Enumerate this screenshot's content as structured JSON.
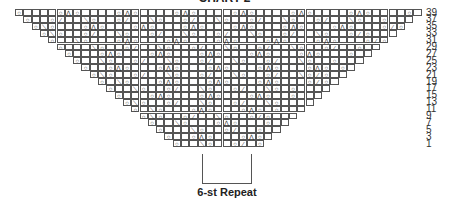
{
  "title": "CHART 2",
  "chart_data": {
    "type": "table",
    "title": "CHART 2",
    "row_labels": [
      "39",
      "37",
      "35",
      "33",
      "31",
      "29",
      "27",
      "25",
      "23",
      "21",
      "19",
      "17",
      "15",
      "13",
      "11",
      "9",
      "7",
      "5",
      "3",
      "1"
    ],
    "legend_symbols": {
      "o": "yarn over",
      "a": "central double decrease",
      "/": "k2tog",
      "\\": "ssk",
      ".": "knit"
    },
    "repeat_label": "6-st Repeat",
    "repeat_width_sts": 6
  },
  "repeat_label": "6-st Repeat",
  "grid": {
    "cell_w": 8.3,
    "row_h": 6.9,
    "left": 15,
    "top": 9,
    "total_cols": 49,
    "rows": [
      "o....oao....oao....oao....oao....oao....oao....o",
      "o..o/..\\o..o/..\\o..o/..\\o..o/..\\o..o/..\\o..o",
      "o\\o...oao...oao...oao...oao...oao...oao...o/o",
      "o\\o..o/..\\o..o/..\\o..o/..\\o..o/..\\o..o/o",
      "o..\\o...oao...oao...oao...oao...oao...o/o",
      "o...\\o..o/..\\o..o/..\\o..o/..\\o..o/..o",
      "o...oao...oao...oao...oao...oao...o",
      "o..\\o..o/..\\o..o/..\\o..o/..\\o..o",
      "o..oao...oao...oao...oao...oao.o",
      "o\\o..o/..\\o..o/..\\o..o/..\\o/o",
      "o.\\o...oao...oao...oao...o/o",
      "o..\\o..o/..\\o..o/..\\o.o",
      "o...oao...oao...oao..o",
      "o\\o..o/..\\o..o/..\\o",
      "o.\\o...oao...oao.o",
      "o\\o..o/..\\o..o/o",
      "o..\\o...oao...o",
      "o...\\o..o/..o",
      "o..oao...oao",
      "o..\\o..o/.o"
    ]
  }
}
